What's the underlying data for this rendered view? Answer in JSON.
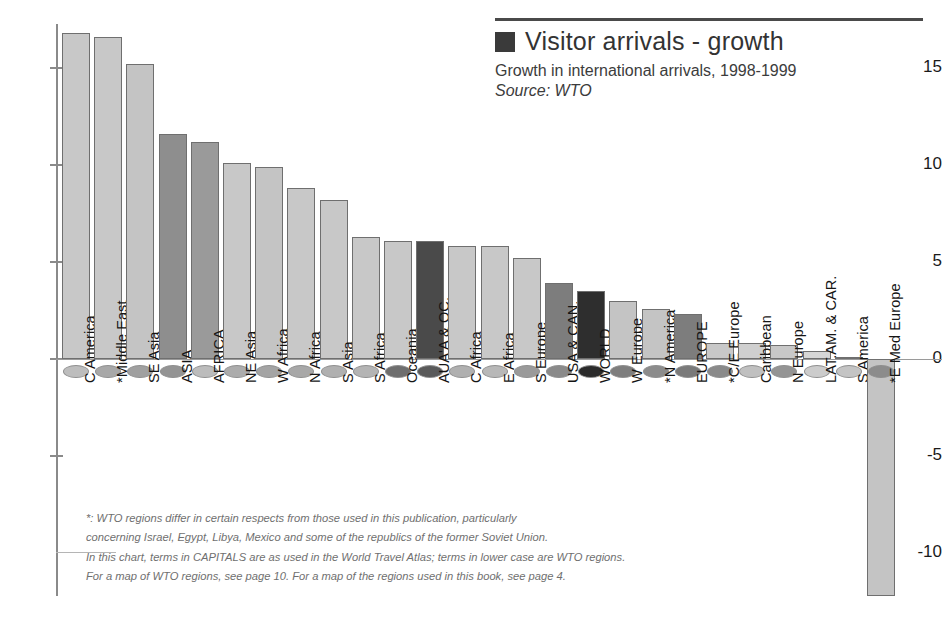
{
  "legend": {
    "swatch_color": "#3a3a3a",
    "title": "Visitor arrivals - growth",
    "subtitle": "Growth in international arrivals, 1998-1999",
    "source": "Source: WTO"
  },
  "axis": {
    "ticks": [
      "15",
      "10",
      "5",
      "0",
      "-5",
      "-10"
    ]
  },
  "note": {
    "line1": "*: WTO regions differ in certain respects from those used in this publication, particularly",
    "line2": "concerning Israel, Egypt, Libya, Mexico and some of the republics of the former Soviet Union.",
    "line3": "In this chart, terms in CAPITALS are as used in the World Travel Atlas; terms in lower case are WTO regions.",
    "line4": "For a map of WTO regions, see page 10. For a map of the regions used in this book, see page 4."
  },
  "chart_data": {
    "type": "bar",
    "title": "Visitor arrivals - growth",
    "subtitle": "Growth in international arrivals, 1998-1999",
    "source": "Source: WTO",
    "xlabel": "",
    "ylabel": "",
    "ylim": [
      -13.5,
      18
    ],
    "yticks": [
      15,
      10,
      5,
      0,
      -5,
      -10
    ],
    "grid": false,
    "legend_position": "top-right",
    "categories": [
      "C America",
      "*Middle East",
      "SE Asia",
      "ASIA",
      "AFRICA",
      "NE Asia",
      "W Africa",
      "N Africa",
      "S Asia",
      "S Africa",
      "Oceania",
      "AUA'A & OC.",
      "C Africa",
      "E Africa",
      "S Europe",
      "USA & CAN.",
      "WORLD",
      "W Europe",
      "*N America",
      "EUROPE",
      "*C/E Europe",
      "Caribbean",
      "N Europe",
      "LAT.AM. & CAR.",
      "S America",
      "*E Med Europe"
    ],
    "values": [
      16.8,
      16.6,
      15.2,
      11.6,
      11.2,
      10.1,
      9.9,
      8.8,
      8.2,
      6.3,
      6.1,
      6.1,
      5.8,
      5.8,
      5.2,
      3.9,
      3.5,
      3.0,
      2.6,
      2.3,
      0.8,
      0.8,
      0.7,
      0.4,
      0.05,
      -12.2
    ],
    "bar_colors": [
      "#c8c8c8",
      "#c8c8c8",
      "#c4c4c4",
      "#8e8e8e",
      "#9a9a9a",
      "#c8c8c8",
      "#c4c4c4",
      "#c8c8c8",
      "#c8c8c8",
      "#c8c8c8",
      "#c8c8c8",
      "#4a4a4a",
      "#c8c8c8",
      "#c8c8c8",
      "#c8c8c8",
      "#7d7d7d",
      "#2e2e2e",
      "#c4c4c4",
      "#c4c4c4",
      "#7d7d7d",
      "#c8c8c8",
      "#cfcfcf",
      "#c8c8c8",
      "#d6d6d6",
      "#d9d9d9",
      "#c4c4c4"
    ],
    "marker_colors": [
      "#bdbdbd",
      "#a8a8a8",
      "#a0a0a0",
      "#949494",
      "#bcbcbc",
      "#acacac",
      "#a4a4a4",
      "#a8a8a8",
      "#b0b0b0",
      "#b4b4b4",
      "#6e6e6e",
      "#5a5a5a",
      "#b0b0b0",
      "#b8b8b8",
      "#9a9a9a",
      "#8a8a8a",
      "#2b2b2b",
      "#7e7e7e",
      "#8c8c8c",
      "#7a7a7a",
      "#8a8a8a",
      "#c0c0c0",
      "#949494",
      "#cccccc",
      "#c4c4c4",
      "#8c8c8c"
    ],
    "units": "percent"
  }
}
